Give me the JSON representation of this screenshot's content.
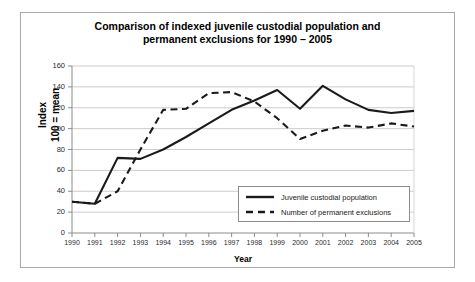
{
  "chart_data": {
    "type": "line",
    "title": "Comparison of indexed juvenile custodial population and permanent exclusions  for 1990 – 2005",
    "title_line1": "Comparison of indexed juvenile custodial population and",
    "title_line2": "permanent exclusions  for 1990 – 2005",
    "xlabel": "Year",
    "ylabel": "Index 100 = mean",
    "ylabel_line1": "Index",
    "ylabel_line2": "100 = mean",
    "categories": [
      "1990",
      "1991",
      "1992",
      "1993",
      "1994",
      "1995",
      "1996",
      "1997",
      "1998",
      "1999",
      "2000",
      "2001",
      "2002",
      "2003",
      "2004",
      "2005"
    ],
    "x": [
      1990,
      1991,
      1992,
      1993,
      1994,
      1995,
      1996,
      1997,
      1998,
      1999,
      2000,
      2001,
      2002,
      2003,
      2004,
      2005
    ],
    "ylim": [
      0,
      160
    ],
    "yticks": [
      0,
      20,
      40,
      60,
      80,
      100,
      120,
      140,
      160
    ],
    "ytick_labels": [
      "0",
      "20",
      "40",
      "60",
      "80",
      "100",
      "120",
      "140",
      "160"
    ],
    "grid": "horizontal",
    "legend_position": "lower-right-inside",
    "series": [
      {
        "name": "Juvenile custodial population",
        "style": "solid",
        "color": "#1a1a1a",
        "values": [
          30,
          28,
          72,
          71,
          80,
          92,
          105,
          118,
          127,
          137,
          119,
          141,
          128,
          118,
          115,
          117
        ]
      },
      {
        "name": "Number of permanent exclusions",
        "style": "dashed",
        "color": "#1a1a1a",
        "values": [
          30,
          28,
          40,
          80,
          118,
          119,
          134,
          135,
          126,
          110,
          90,
          98,
          103,
          101,
          105,
          102
        ]
      }
    ]
  },
  "legend": {
    "items": [
      {
        "label": "Juvenile custodial population",
        "style": "solid"
      },
      {
        "label": "Number of permanent exclusions",
        "style": "dashed"
      }
    ]
  }
}
